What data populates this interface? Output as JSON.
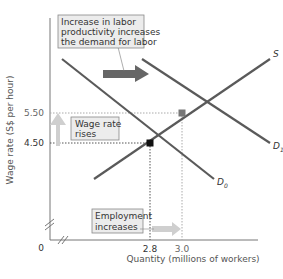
{
  "chart_data": {
    "type": "line",
    "title": "",
    "xlabel": "Quantity (millions of workers)",
    "ylabel": "Wage rate (S$ per hour)",
    "x_ticks": [
      {
        "value": 2.8,
        "label": "2.8"
      },
      {
        "value": 3.0,
        "label": "3.0"
      }
    ],
    "y_ticks": [
      {
        "value": 4.5,
        "label": "4.50"
      },
      {
        "value": 5.5,
        "label": "5.50"
      }
    ],
    "origin_label": "0",
    "axis_breaks": true,
    "series": [
      {
        "name": "S",
        "label": "S",
        "kind": "supply",
        "points": [
          [
            2.45,
            3.3
          ],
          [
            3.55,
            7.3
          ]
        ]
      },
      {
        "name": "D0",
        "label": "D",
        "sub": "0",
        "kind": "demand-initial",
        "points": [
          [
            2.25,
            7.3
          ],
          [
            3.2,
            3.3
          ]
        ]
      },
      {
        "name": "D1",
        "label": "D",
        "sub": "1",
        "kind": "demand-new",
        "points": [
          [
            2.75,
            7.3
          ],
          [
            3.55,
            4.5
          ]
        ]
      }
    ],
    "equilibria": [
      {
        "name": "initial",
        "x": 2.8,
        "y": 4.5,
        "marker": "black-square"
      },
      {
        "name": "new",
        "x": 3.0,
        "y": 5.5,
        "marker": "gray-square"
      }
    ],
    "annotations": [
      {
        "id": "productivity",
        "lines": [
          "Increase in labor",
          "productivity increases",
          "the demand for labor"
        ]
      },
      {
        "id": "wage",
        "lines": [
          "Wage rate",
          "rises"
        ]
      },
      {
        "id": "employment",
        "lines": [
          "Employment",
          "increases"
        ]
      }
    ],
    "grid": false
  },
  "colors": {
    "curve": "#5a5a5a",
    "shift_arrow": "#666666",
    "light_arrow": "#cfcfcf",
    "guide": "#999999",
    "box_fill": "#ececec"
  }
}
